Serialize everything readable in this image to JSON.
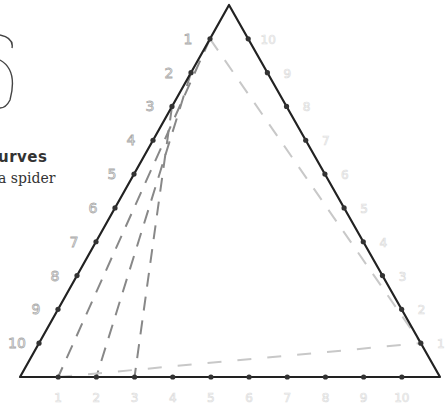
{
  "title": "urves",
  "subtitle": "a spider",
  "diagram": {
    "type": "curve-stitching-triangle",
    "vertices": {
      "top": [
        229,
        5
      ],
      "bottom_left": [
        20,
        377
      ],
      "bottom_right": [
        440,
        377
      ]
    },
    "left_labels": [
      "1",
      "2",
      "3",
      "4",
      "5",
      "6",
      "7",
      "8",
      "9",
      "10"
    ],
    "bottom_labels": [
      "1",
      "2",
      "3",
      "4",
      "5",
      "6",
      "7",
      "8",
      "9",
      "10"
    ],
    "right_labels": [
      "10",
      "9",
      "8",
      "7",
      "6",
      "5",
      "4",
      "3",
      "2",
      "1"
    ],
    "colors": {
      "outline": "#222222",
      "dashed_dark": "#888888",
      "dashed_light": "#c8c8c8",
      "label_stroke": "#aaaaaa"
    }
  }
}
